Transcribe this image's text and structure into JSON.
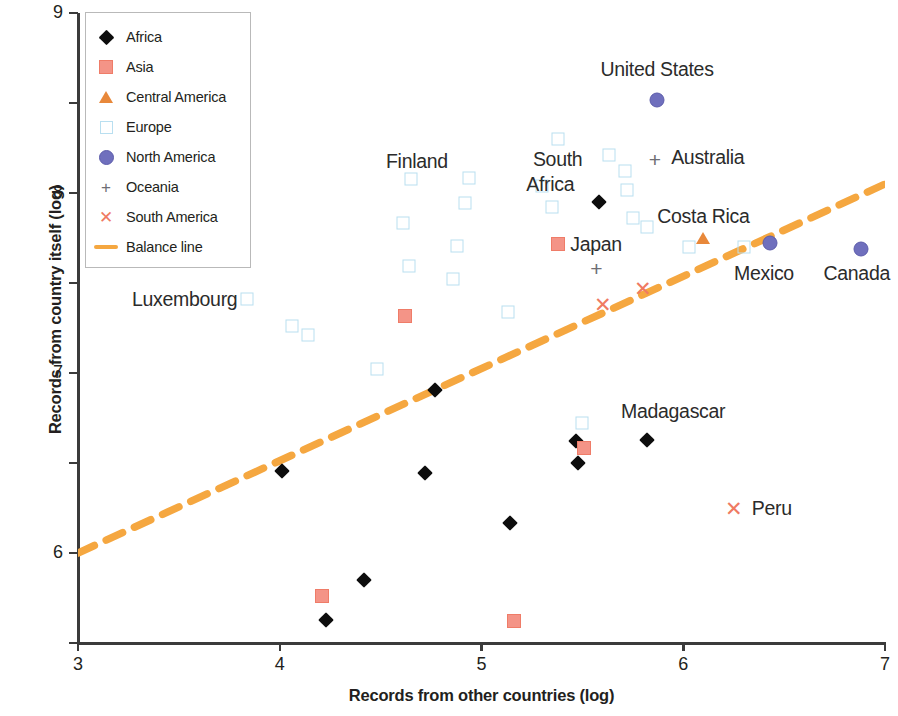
{
  "chart_data": {
    "type": "scatter",
    "title": "",
    "xlabel": "Records from other countries (log)",
    "ylabel": "Records from country itself (log)",
    "xlim": [
      3,
      7
    ],
    "ylim": [
      2,
      9
    ],
    "xticks": [
      "3",
      "4",
      "5",
      "6",
      "7"
    ],
    "yticks": [
      "2",
      "3",
      "4",
      "5",
      "6",
      "7",
      "8",
      "9"
    ],
    "grid": false,
    "legend_position": "top-left",
    "colors": {
      "africa": "#0d0d0d",
      "asia": "#f49487",
      "central_america": "#e8883a",
      "europe": "#b9dff0",
      "north_america": "#6f6fbd",
      "oceania": "#6e6e74",
      "south_america": "#ef7a62",
      "balance_line": "#f5a740",
      "axis": "#3b3b3b",
      "text": "#231f20"
    },
    "legend": [
      {
        "label": "Africa",
        "marker": "diamond-filled-black-icon",
        "key": "africa"
      },
      {
        "label": "Asia",
        "marker": "square-filled-salmon-icon",
        "key": "asia"
      },
      {
        "label": "Central America",
        "marker": "triangle-orange-icon",
        "key": "central_america"
      },
      {
        "label": "Europe",
        "marker": "square-outline-lightblue-icon",
        "key": "europe"
      },
      {
        "label": "North America",
        "marker": "circle-filled-purple-icon",
        "key": "north_america"
      },
      {
        "label": "Oceania",
        "marker": "plus-gray-icon",
        "key": "oceania"
      },
      {
        "label": "South America",
        "marker": "cross-salmon-icon",
        "key": "south_america"
      },
      {
        "label": "Balance line",
        "marker": "dashed-line-orange-icon",
        "key": "balance_line"
      }
    ],
    "balance_line": {
      "label": "Balance line",
      "x": [
        3.0,
        7.0
      ],
      "y": [
        3.0,
        7.1
      ],
      "style": "dashed",
      "color": "#f5a740"
    },
    "series": [
      {
        "name": "Africa",
        "key": "africa",
        "marker": "diamond",
        "points": [
          {
            "x": 4.23,
            "y": 2.26
          },
          {
            "x": 4.42,
            "y": 2.7
          },
          {
            "x": 5.14,
            "y": 3.33
          },
          {
            "x": 5.48,
            "y": 4.0
          },
          {
            "x": 5.47,
            "y": 4.25
          },
          {
            "x": 4.72,
            "y": 3.89
          },
          {
            "x": 4.01,
            "y": 3.91
          },
          {
            "x": 4.77,
            "y": 4.81
          },
          {
            "x": 5.58,
            "y": 6.9,
            "label": "South Africa"
          },
          {
            "x": 5.82,
            "y": 4.26,
            "label": "Madagascar"
          }
        ]
      },
      {
        "name": "Asia",
        "key": "asia",
        "marker": "square",
        "points": [
          {
            "x": 4.21,
            "y": 2.52
          },
          {
            "x": 5.16,
            "y": 2.25
          },
          {
            "x": 4.62,
            "y": 5.63
          },
          {
            "x": 5.51,
            "y": 4.17
          },
          {
            "x": 5.38,
            "y": 6.43,
            "label": "Japan"
          }
        ]
      },
      {
        "name": "Central America",
        "key": "central_america",
        "marker": "triangle",
        "points": [
          {
            "x": 6.1,
            "y": 6.5,
            "label": "Costa Rica"
          }
        ]
      },
      {
        "name": "Europe",
        "key": "europe",
        "marker": "square-outline",
        "points": [
          {
            "x": 3.84,
            "y": 5.82,
            "label": "Luxembourg"
          },
          {
            "x": 4.06,
            "y": 5.52
          },
          {
            "x": 4.14,
            "y": 5.42
          },
          {
            "x": 4.48,
            "y": 5.04
          },
          {
            "x": 4.61,
            "y": 6.67
          },
          {
            "x": 4.64,
            "y": 6.19
          },
          {
            "x": 4.65,
            "y": 7.16,
            "label": "Finland"
          },
          {
            "x": 4.94,
            "y": 7.17
          },
          {
            "x": 4.92,
            "y": 6.89
          },
          {
            "x": 4.88,
            "y": 6.41
          },
          {
            "x": 4.86,
            "y": 6.05
          },
          {
            "x": 5.13,
            "y": 5.68
          },
          {
            "x": 5.3,
            "y": 7.08
          },
          {
            "x": 5.35,
            "y": 6.85
          },
          {
            "x": 5.38,
            "y": 7.6
          },
          {
            "x": 5.5,
            "y": 4.45
          },
          {
            "x": 5.63,
            "y": 7.42
          },
          {
            "x": 5.71,
            "y": 7.24
          },
          {
            "x": 5.72,
            "y": 7.03
          },
          {
            "x": 5.75,
            "y": 6.72
          },
          {
            "x": 6.03,
            "y": 6.4
          },
          {
            "x": 6.3,
            "y": 6.4
          },
          {
            "x": 5.82,
            "y": 6.62
          }
        ]
      },
      {
        "name": "North America",
        "key": "north_america",
        "marker": "circle",
        "points": [
          {
            "x": 5.87,
            "y": 8.03,
            "label": "United States"
          },
          {
            "x": 6.43,
            "y": 6.45,
            "label": "Mexico"
          },
          {
            "x": 6.88,
            "y": 6.38,
            "label": "Canada"
          }
        ]
      },
      {
        "name": "Oceania",
        "key": "oceania",
        "marker": "plus",
        "points": [
          {
            "x": 5.86,
            "y": 7.38,
            "label": "Australia"
          },
          {
            "x": 5.57,
            "y": 6.17
          }
        ]
      },
      {
        "name": "South America",
        "key": "south_america",
        "marker": "cross",
        "points": [
          {
            "x": 5.6,
            "y": 5.77
          },
          {
            "x": 5.8,
            "y": 5.95
          },
          {
            "x": 6.25,
            "y": 3.5,
            "label": "Peru"
          }
        ]
      }
    ],
    "annotations": [
      {
        "text": "United States",
        "x": 5.87,
        "y": 8.38,
        "align": "center"
      },
      {
        "text": "Australia",
        "x": 5.94,
        "y": 7.4,
        "align": "left"
      },
      {
        "text": "South",
        "x": 5.5,
        "y": 7.38,
        "align": "right"
      },
      {
        "text": "Africa",
        "x": 5.46,
        "y": 7.1,
        "align": "right"
      },
      {
        "text": "Finland",
        "x": 4.68,
        "y": 7.36,
        "align": "center"
      },
      {
        "text": "Costa Rica",
        "x": 6.1,
        "y": 6.74,
        "align": "center"
      },
      {
        "text": "Japan",
        "x": 5.44,
        "y": 6.43,
        "align": "left"
      },
      {
        "text": "Mexico",
        "x": 6.4,
        "y": 6.11,
        "align": "center"
      },
      {
        "text": "Canada",
        "x": 6.86,
        "y": 6.11,
        "align": "center"
      },
      {
        "text": "Luxembourg",
        "x": 3.79,
        "y": 5.82,
        "align": "right"
      },
      {
        "text": "Madagascar",
        "x": 5.95,
        "y": 4.58,
        "align": "center"
      },
      {
        "text": "Peru",
        "x": 6.34,
        "y": 3.5,
        "align": "left"
      }
    ]
  }
}
